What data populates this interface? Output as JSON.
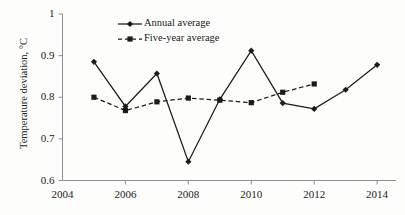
{
  "chart_data": {
    "type": "line",
    "title": "",
    "xlabel": "",
    "ylabel": "Temperature deviation, °C",
    "xlim": [
      2004,
      2014.6
    ],
    "ylim": [
      0.6,
      1.0
    ],
    "grid": false,
    "legend_position": "top-left inside",
    "x_ticks": [
      "2004",
      "2006",
      "2008",
      "2010",
      "2012",
      "2014"
    ],
    "x_tick_values": [
      2004,
      2006,
      2008,
      2010,
      2012,
      2014
    ],
    "y_ticks": [
      "0.6",
      "0.7",
      "0.8",
      "0.9",
      "1"
    ],
    "y_tick_values": [
      0.6,
      0.7,
      0.8,
      0.9,
      1.0
    ],
    "series": [
      {
        "name": "Annual average",
        "marker": "diamond",
        "line_style": "solid",
        "color": "#1b1b1b",
        "x": [
          2005,
          2006,
          2007,
          2008,
          2009,
          2010,
          2011,
          2012,
          2013,
          2014
        ],
        "values": [
          0.885,
          0.778,
          0.857,
          0.645,
          0.795,
          0.912,
          0.786,
          0.772,
          0.818,
          0.878
        ]
      },
      {
        "name": "Five-year average",
        "marker": "square",
        "line_style": "dashed",
        "color": "#1b1b1b",
        "x": [
          2005,
          2006,
          2007,
          2008,
          2009,
          2010,
          2011,
          2012
        ],
        "values": [
          0.8,
          0.768,
          0.789,
          0.798,
          0.793,
          0.787,
          0.812,
          0.832
        ]
      }
    ]
  },
  "legend": {
    "items": [
      {
        "label": "Annual average"
      },
      {
        "label": "Five-year average"
      }
    ]
  },
  "axis": {
    "y_title": "Temperature deviation, °C"
  }
}
